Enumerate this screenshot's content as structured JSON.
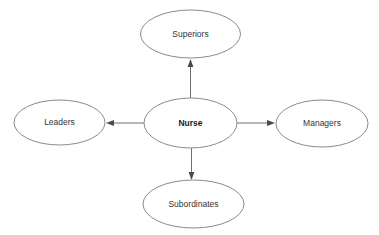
{
  "diagram": {
    "type": "radial-relationship-map",
    "background_color": "#ffffff",
    "node_stroke_color": "#8b8b8b",
    "edge_color": "#6f6f6f",
    "label_color": "#333333",
    "center": {
      "label": "Nurse",
      "emphasis": "bold",
      "cx": 190.5,
      "cy": 123,
      "rx": 46.5,
      "ry": 25
    },
    "nodes": [
      {
        "id": "superiors",
        "label": "Superiors",
        "direction": "up",
        "cx": 190.5,
        "cy": 34,
        "rx": 50,
        "ry": 24
      },
      {
        "id": "leaders",
        "label": "Leaders",
        "direction": "left",
        "cx": 59.5,
        "cy": 122.5,
        "rx": 45.5,
        "ry": 22.5
      },
      {
        "id": "managers",
        "label": "Managers",
        "direction": "right",
        "cx": 322,
        "cy": 123.5,
        "rx": 46,
        "ry": 23.5
      },
      {
        "id": "subordinates",
        "label": "Subordinates",
        "direction": "down",
        "cx": 193.5,
        "cy": 204,
        "rx": 50.5,
        "ry": 24
      }
    ],
    "edges": [
      {
        "id": "edge-nurse-superiors",
        "from": "Nurse",
        "to": "Superiors",
        "arrow": "outward"
      },
      {
        "id": "edge-nurse-leaders",
        "from": "Nurse",
        "to": "Leaders",
        "arrow": "outward"
      },
      {
        "id": "edge-nurse-managers",
        "from": "Nurse",
        "to": "Managers",
        "arrow": "outward"
      },
      {
        "id": "edge-nurse-subordinates",
        "from": "Nurse",
        "to": "Subordinates",
        "arrow": "outward"
      }
    ]
  }
}
